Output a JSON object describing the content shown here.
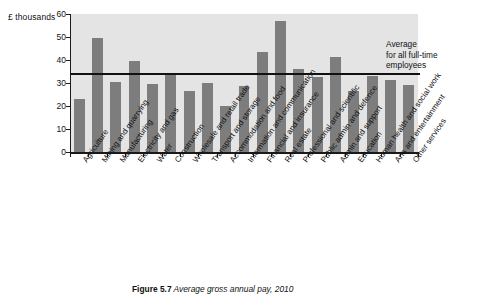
{
  "chart_data": {
    "type": "bar",
    "title": "Average gross annual pay, 2010",
    "figure_number": "Figure 5.7",
    "xlabel": "",
    "ylabel": "£ thousands",
    "ylim": [
      0,
      60
    ],
    "yticks": [
      0,
      10,
      20,
      30,
      40,
      50,
      60
    ],
    "grid": false,
    "legend": "none",
    "bar_color": "#7d7d7d",
    "plot_background": "#e4e4e4",
    "categories": [
      "Agriculture",
      "Mining and quarrying",
      "Manufacturing",
      "Electricity and gas",
      "Water",
      "Construction",
      "Wholesale and retail trade",
      "Transport and storage",
      "Accommodation and food",
      "Information and communication",
      "Financial and insurance",
      "Real estate",
      "Professional and scientific",
      "Public admin and defence",
      "Admin and support",
      "Education",
      "Human health and social work",
      "Arts and entertainment",
      "Other services"
    ],
    "values": [
      23,
      49.5,
      30.5,
      39.5,
      29.5,
      33.5,
      26.5,
      30,
      20,
      28.5,
      43.5,
      57,
      36,
      32.5,
      41.5,
      26.5,
      33,
      31.5,
      29
    ],
    "annotations": [
      {
        "name": "average-line",
        "label": "Average\nfor all full-time\nemployees",
        "value": 34,
        "type": "horizontal-line",
        "color": "#111111"
      }
    ]
  },
  "caption": {
    "figure_label": "Figure 5.7",
    "text": "Average gross annual pay, 2010"
  }
}
